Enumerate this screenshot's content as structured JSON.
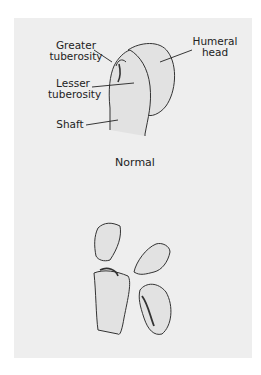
{
  "figure": {
    "panels": [
      {
        "name": "normal",
        "caption": "Normal",
        "labels": {
          "greater_tuberosity_1": "Greater",
          "greater_tuberosity_2": "tuberosity",
          "humeral_head_1": "Humeral",
          "humeral_head_2": "head",
          "lesser_tuberosity_1": "Lesser",
          "lesser_tuberosity_2": "tuberosity",
          "shaft": "Shaft"
        }
      },
      {
        "name": "fractured",
        "caption": ""
      }
    ],
    "colors": {
      "panel_bg": "#eeeeee",
      "bone_fill": "#e2e2e2",
      "line": "#333333"
    }
  }
}
